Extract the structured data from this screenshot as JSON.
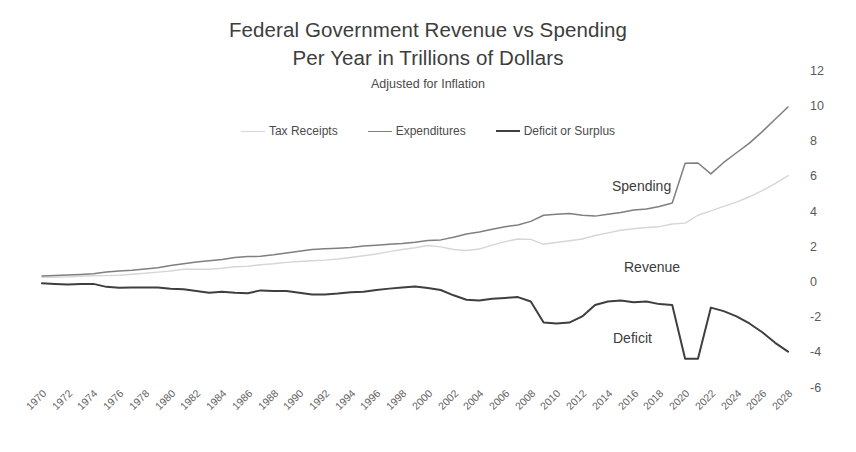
{
  "chart_data": {
    "type": "line",
    "title": "Federal Government Revenue vs Spending Per Year in Trillions of Dollars",
    "title_line1": "Federal Government Revenue vs Spending",
    "title_line2": "Per Year in Trillions of Dollars",
    "subtitle": "Adjusted for Inflation",
    "xlabel": "",
    "ylabel": "",
    "ylim": [
      -6,
      12
    ],
    "yticks": [
      12,
      10,
      8,
      6,
      4,
      2,
      0,
      -2,
      -4,
      -6
    ],
    "ytick_labels": [
      "12",
      "10",
      "8",
      "6",
      "4",
      "2",
      "0",
      "-2",
      "-4",
      "-6"
    ],
    "y_axis_position": "right",
    "grid": false,
    "legend_position": "top-center",
    "x": [
      1970,
      1971,
      1972,
      1973,
      1974,
      1975,
      1976,
      1977,
      1978,
      1979,
      1980,
      1981,
      1982,
      1983,
      1984,
      1985,
      1986,
      1987,
      1988,
      1989,
      1990,
      1991,
      1992,
      1993,
      1994,
      1995,
      1996,
      1997,
      1998,
      1999,
      2000,
      2001,
      2002,
      2003,
      2004,
      2005,
      2006,
      2007,
      2008,
      2009,
      2010,
      2011,
      2012,
      2013,
      2014,
      2015,
      2016,
      2017,
      2018,
      2019,
      2020,
      2021,
      2022,
      2023,
      2024,
      2025,
      2026,
      2027,
      2028
    ],
    "xtick_labels": [
      "1970",
      "1972",
      "1974",
      "1976",
      "1978",
      "1980",
      "1982",
      "1984",
      "1986",
      "1988",
      "1990",
      "1992",
      "1994",
      "1996",
      "1998",
      "2000",
      "2002",
      "2004",
      "2006",
      "2008",
      "2010",
      "2012",
      "2014",
      "2016",
      "2018",
      "2020",
      "2022",
      "2024",
      "2026",
      "2028"
    ],
    "xtick_rotation": -45,
    "series": [
      {
        "name": "Tax Receipts",
        "annotation": "Revenue",
        "color": "#d6d6d6",
        "values": [
          0.32,
          0.33,
          0.35,
          0.38,
          0.41,
          0.42,
          0.44,
          0.5,
          0.55,
          0.62,
          0.68,
          0.78,
          0.79,
          0.78,
          0.84,
          0.92,
          0.95,
          1.04,
          1.09,
          1.17,
          1.22,
          1.26,
          1.3,
          1.36,
          1.45,
          1.55,
          1.65,
          1.78,
          1.9,
          2.0,
          2.13,
          2.05,
          1.9,
          1.85,
          1.93,
          2.15,
          2.35,
          2.5,
          2.48,
          2.2,
          2.3,
          2.4,
          2.5,
          2.7,
          2.85,
          3.0,
          3.08,
          3.15,
          3.2,
          3.35,
          3.4,
          3.85,
          4.1,
          4.35,
          4.6,
          4.9,
          5.25,
          5.65,
          6.1
        ]
      },
      {
        "name": "Expenditures",
        "annotation": "Spending",
        "color": "#7f7f7f",
        "values": [
          0.4,
          0.42,
          0.45,
          0.48,
          0.52,
          0.62,
          0.68,
          0.72,
          0.79,
          0.87,
          0.99,
          1.1,
          1.19,
          1.27,
          1.33,
          1.45,
          1.5,
          1.52,
          1.6,
          1.7,
          1.8,
          1.9,
          1.95,
          1.98,
          2.02,
          2.1,
          2.15,
          2.2,
          2.25,
          2.32,
          2.42,
          2.45,
          2.6,
          2.78,
          2.9,
          3.05,
          3.2,
          3.3,
          3.5,
          3.85,
          3.9,
          3.95,
          3.85,
          3.8,
          3.9,
          4.0,
          4.15,
          4.2,
          4.35,
          4.55,
          6.8,
          6.82,
          6.2,
          6.85,
          7.4,
          7.95,
          8.6,
          9.3,
          10.0
        ]
      },
      {
        "name": "Deficit or Surplus",
        "annotation": "Deficit",
        "color": "#3f3f3f",
        "values": [
          -0.02,
          -0.05,
          -0.08,
          -0.06,
          -0.05,
          -0.22,
          -0.27,
          -0.25,
          -0.26,
          -0.25,
          -0.32,
          -0.35,
          -0.45,
          -0.55,
          -0.5,
          -0.55,
          -0.58,
          -0.42,
          -0.45,
          -0.45,
          -0.55,
          -0.65,
          -0.65,
          -0.6,
          -0.52,
          -0.5,
          -0.4,
          -0.32,
          -0.25,
          -0.2,
          -0.28,
          -0.4,
          -0.7,
          -0.95,
          -1.0,
          -0.9,
          -0.85,
          -0.8,
          -1.05,
          -2.25,
          -2.3,
          -2.25,
          -1.9,
          -1.25,
          -1.05,
          -1.0,
          -1.1,
          -1.05,
          -1.2,
          -1.25,
          -4.3,
          -4.3,
          -1.4,
          -1.6,
          -1.9,
          -2.3,
          -2.8,
          -3.4,
          -3.9
        ]
      }
    ]
  },
  "axis_geometry": {
    "plot_left": 42,
    "plot_right": 788,
    "y_zero_px": 283,
    "px_per_unit": 17.6
  },
  "annotations": {
    "spending_label": "Spending",
    "revenue_label": "Revenue",
    "deficit_label": "Deficit"
  }
}
